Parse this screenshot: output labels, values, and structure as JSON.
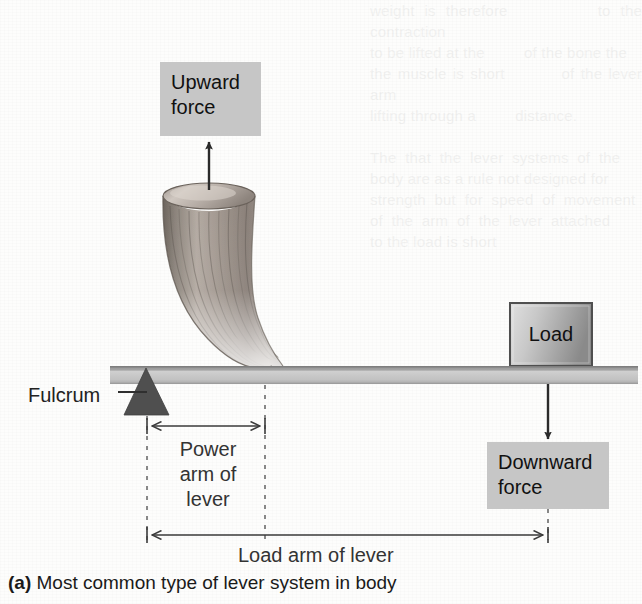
{
  "figure": {
    "caption_marker": "(a)",
    "caption_text": "Most common type of lever system in body",
    "background_color": "#fdfdfc",
    "ink_color": "#333333"
  },
  "labels": {
    "upward_force": "Upward\nforce",
    "downward_force": "Downward\nforce",
    "fulcrum": "Fulcrum",
    "load": "Load",
    "power_arm": "Power\narm of\nlever",
    "load_arm": "Load arm of lever"
  },
  "elements": {
    "lever_bar": {
      "name": "lever-bar",
      "fill_top": "#9a9a9a",
      "fill_body": "#c0c0c0",
      "x": 110,
      "y": 366,
      "width": 528,
      "height": 18
    },
    "fulcrum_triangle": {
      "name": "fulcrum-triangle",
      "fill": "#5a5a5a",
      "apex_x": 146,
      "apex_y": 368,
      "base_left_x": 124,
      "base_right_x": 169,
      "base_y": 415
    },
    "muscle": {
      "name": "muscle-belly",
      "description": "curved tapering muscle with vertical striations",
      "top_center_x": 209,
      "top_y": 188,
      "attachment_x": 266,
      "attachment_y": 366,
      "fill_light": "#e8e4e0",
      "fill_mid": "#a89f98",
      "fill_dark": "#6e665f"
    },
    "load_block": {
      "name": "load-block",
      "x": 510,
      "y": 303,
      "width": 82,
      "height": 63,
      "fill_light": "#d8d8d8",
      "fill_dark": "#8d8d8d",
      "stroke": "#555555"
    },
    "upward_arrow": {
      "name": "upward-force-arrow",
      "x": 209,
      "from_y": 191,
      "to_y": 140
    },
    "downward_arrow": {
      "name": "downward-force-arrow",
      "x": 548,
      "from_y": 384,
      "to_y": 441
    },
    "power_arm_dimension": {
      "name": "power-arm-dimension",
      "y": 426,
      "from_x": 147,
      "to_x": 265
    },
    "load_arm_dimension": {
      "name": "load-arm-dimension",
      "y": 535,
      "from_x": 147,
      "to_x": 548
    },
    "dashed_guides": [
      {
        "name": "fulcrum-guide",
        "x": 147,
        "from_y": 416,
        "to_y": 538
      },
      {
        "name": "muscle-insertion-guide",
        "x": 265,
        "from_y": 384,
        "to_y": 538
      },
      {
        "name": "load-guide",
        "x": 548,
        "from_y": 510,
        "to_y": 538
      }
    ],
    "fulcrum_leader": {
      "name": "fulcrum-leader-line",
      "from_x": 120,
      "to_x": 147,
      "y": 392
    }
  },
  "ghost_bleedthrough": "weight is therefore         to the contraction\nto be lifted at the         of the bone the\nthe muscle is short         of the lever arm\nlifting through a         distance.\n\nThe  that  the  lever  systems  of  the\nbody are as a rule not designed for\nstrength  but  for  speed  of  movement\nof  the  arm  of  the  lever  attached\nto the load is short"
}
